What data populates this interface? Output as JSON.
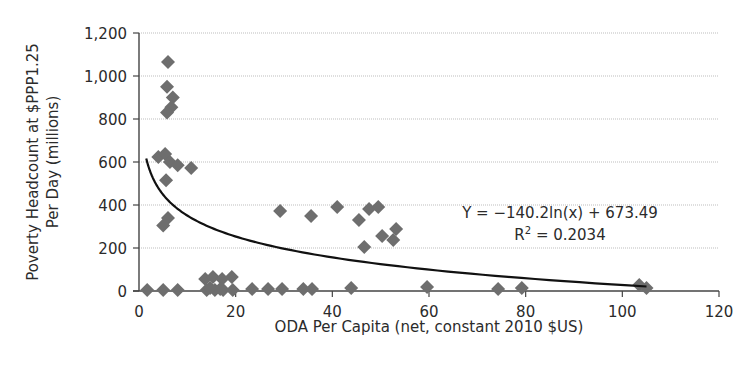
{
  "chart_data": {
    "type": "scatter",
    "title": "",
    "xlabel": "ODA Per Capita (net, constant 2010 $US)",
    "ylabel_lines": [
      "Poverty Headcount at $PPP1.25",
      "Per Day (millions)"
    ],
    "xlim": [
      0,
      120
    ],
    "ylim": [
      0,
      1200
    ],
    "xticks": [
      0,
      20,
      40,
      60,
      80,
      100,
      120
    ],
    "yticks": [
      0,
      200,
      400,
      600,
      800,
      1000,
      1200
    ],
    "ytick_labels": [
      "0",
      "200",
      "400",
      "600",
      "800",
      "1,000",
      "1,200"
    ],
    "grid": "horizontal",
    "legend": "none",
    "series": [
      {
        "name": "Countries",
        "marker": "diamond",
        "color": "#6e6e6e",
        "points": [
          [
            6,
            1065
          ],
          [
            5.8,
            950
          ],
          [
            7,
            900
          ],
          [
            6.7,
            855
          ],
          [
            5.8,
            830
          ],
          [
            4,
            623
          ],
          [
            5.4,
            637
          ],
          [
            6.4,
            600
          ],
          [
            8,
            585
          ],
          [
            10.8,
            572
          ],
          [
            5.6,
            515
          ],
          [
            5,
            305
          ],
          [
            6,
            340
          ],
          [
            29.2,
            372
          ],
          [
            35.6,
            349
          ],
          [
            41,
            391
          ],
          [
            45.5,
            330
          ],
          [
            47.6,
            381
          ],
          [
            49.5,
            391
          ],
          [
            50.3,
            256
          ],
          [
            53.2,
            288
          ],
          [
            52.6,
            237
          ],
          [
            46.6,
            205
          ],
          [
            1.7,
            5
          ],
          [
            5,
            5
          ],
          [
            8,
            5
          ],
          [
            14,
            5
          ],
          [
            15.7,
            5
          ],
          [
            17.4,
            5
          ],
          [
            19.4,
            5
          ],
          [
            13.7,
            56
          ],
          [
            15.3,
            65
          ],
          [
            17.2,
            56
          ],
          [
            19.2,
            65
          ],
          [
            14.7,
            14
          ],
          [
            16.8,
            9
          ],
          [
            23.4,
            9
          ],
          [
            26.7,
            9
          ],
          [
            29.6,
            9
          ],
          [
            34,
            9
          ],
          [
            35.8,
            9
          ],
          [
            43.9,
            14
          ],
          [
            59.6,
            19
          ],
          [
            74.3,
            9
          ],
          [
            79.2,
            14
          ],
          [
            103.5,
            28
          ],
          [
            105,
            14
          ]
        ]
      }
    ],
    "trendline": {
      "type": "logarithmic",
      "a": -140.2,
      "b": 673.49,
      "x_range": [
        1.5,
        105
      ],
      "color": "#111111"
    },
    "annotations": {
      "equation": "Y = −140.2ln(x) + 673.49",
      "r2_prefix": "R",
      "r2_sup": "2",
      "r2_value": " = 0.2034"
    }
  }
}
